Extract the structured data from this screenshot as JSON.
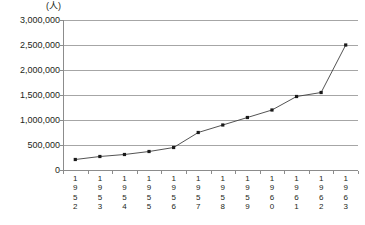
{
  "chart_data": {
    "type": "line",
    "title": "",
    "unit_label": "(人)",
    "xlabel": "",
    "ylabel": "",
    "categories": [
      "1952",
      "1953",
      "1954",
      "1955",
      "1956",
      "1957",
      "1958",
      "1959",
      "1960",
      "1961",
      "1962",
      "1963"
    ],
    "values": [
      210000,
      270000,
      310000,
      370000,
      450000,
      750000,
      900000,
      1050000,
      1200000,
      1470000,
      1550000,
      2500000
    ],
    "ylim": [
      0,
      3000000
    ],
    "yticks": [
      0,
      500000,
      1000000,
      1500000,
      2000000,
      2500000,
      3000000
    ],
    "ytick_labels": [
      "0",
      "500,000",
      "1,000,000",
      "1,500,000",
      "2,000,000",
      "2,500,000",
      "3,000,000"
    ],
    "grid": true,
    "legend": "none",
    "series_color": "#404040",
    "marker": "square",
    "grid_color": "#a6a6a6",
    "axis_color": "#8c8c8c"
  }
}
